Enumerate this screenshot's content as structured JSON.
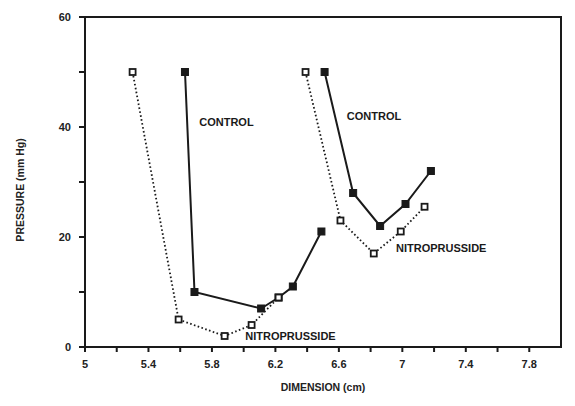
{
  "chart_data": {
    "type": "line",
    "title": "",
    "xlabel": "DIMENSION (cm)",
    "ylabel": "PRESSURE (mm Hg)",
    "xlim": [
      5,
      8
    ],
    "ylim": [
      0,
      60
    ],
    "x_ticks": [
      5,
      5.4,
      5.8,
      6.2,
      6.6,
      7,
      7.4,
      7.8
    ],
    "x_tick_labels": [
      "5",
      "5.4",
      "5.8",
      "6.2",
      "6.6",
      "7",
      "7.4",
      "7.8"
    ],
    "x_minor_ticks": [
      5.2,
      5.6,
      6.0,
      6.4,
      6.8,
      7.2,
      7.6
    ],
    "y_ticks": [
      0,
      20,
      40,
      60
    ],
    "y_tick_labels": [
      "0",
      "20",
      "40",
      "60"
    ],
    "y_minor_ticks": [
      10,
      30,
      50
    ],
    "grid": false,
    "legend": null,
    "series": [
      {
        "name": "CONTROL (left loop)",
        "style": "solid",
        "marker": "filled-square",
        "x": [
          5.63,
          5.69,
          6.11,
          6.22,
          6.31,
          6.49
        ],
        "y": [
          50,
          10,
          7,
          9,
          11,
          21
        ]
      },
      {
        "name": "NITROPRUSSIDE (left loop)",
        "style": "dotted",
        "marker": "open-square",
        "x": [
          5.3,
          5.59,
          5.88,
          6.05,
          6.22
        ],
        "y": [
          50,
          5,
          2,
          4,
          9
        ]
      },
      {
        "name": "CONTROL (right loop)",
        "style": "solid",
        "marker": "filled-square",
        "x": [
          6.51,
          6.69,
          6.86,
          7.02,
          7.18
        ],
        "y": [
          50,
          28,
          22,
          26,
          32
        ]
      },
      {
        "name": "NITROPRUSSIDE (right loop)",
        "style": "dotted",
        "marker": "open-square",
        "x": [
          6.39,
          6.61,
          6.82,
          6.99,
          7.14
        ],
        "y": [
          50,
          23,
          17,
          21,
          25.5
        ]
      }
    ],
    "annotations": [
      {
        "text": "CONTROL",
        "x": 5.72,
        "y": 41
      },
      {
        "text": "NITROPRUSSIDE",
        "x": 6.01,
        "y": 2
      },
      {
        "text": "CONTROL",
        "x": 6.65,
        "y": 42
      },
      {
        "text": "NITROPRUSSIDE",
        "x": 6.96,
        "y": 18
      }
    ]
  }
}
